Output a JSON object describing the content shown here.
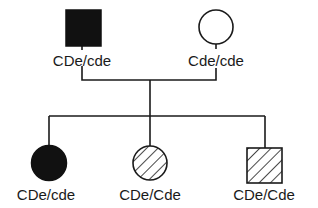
{
  "diagram": {
    "type": "pedigree",
    "colors": {
      "stroke": "#1a1a1a",
      "affected_fill": "#111111",
      "background": "#ffffff"
    },
    "parents": [
      {
        "role": "father",
        "shape": "square",
        "fill": "solid",
        "genotype": "CDe/cde"
      },
      {
        "role": "mother",
        "shape": "circle",
        "fill": "open",
        "genotype": "Cde/cde"
      }
    ],
    "children": [
      {
        "sex": "female",
        "shape": "circle",
        "fill": "solid",
        "genotype": "CDe/cde"
      },
      {
        "sex": "female",
        "shape": "circle",
        "fill": "hatched",
        "genotype": "CDe/Cde"
      },
      {
        "sex": "male",
        "shape": "square",
        "fill": "hatched",
        "genotype": "CDe/Cde"
      }
    ]
  }
}
